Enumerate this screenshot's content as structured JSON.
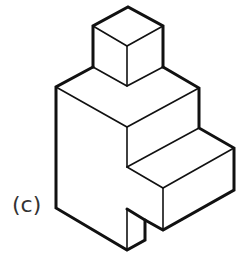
{
  "figure": {
    "label": "(c)",
    "stroke_color": "#111111",
    "background": "#ffffff"
  }
}
